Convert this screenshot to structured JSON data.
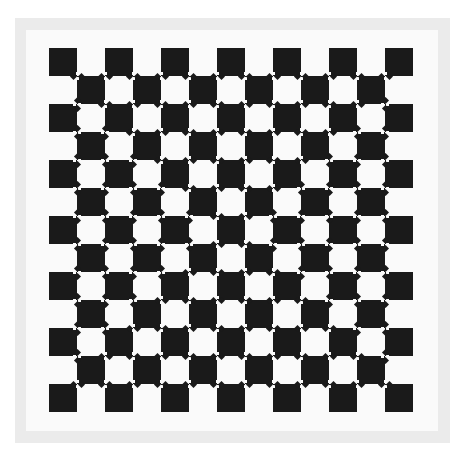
{
  "colors": {
    "background": "#ffffff",
    "frame": "#ebebeb",
    "interior": "#fafafa",
    "square": "#1a1a1a"
  },
  "frame": {
    "outer": [
      15,
      18,
      450,
      443
    ],
    "inner": [
      26,
      30,
      438,
      431
    ]
  },
  "board": {
    "rows": 13,
    "cols": 13,
    "cell_size": 28,
    "origin": [
      49,
      48
    ],
    "dark_parity": 0,
    "mark_size": 5
  }
}
